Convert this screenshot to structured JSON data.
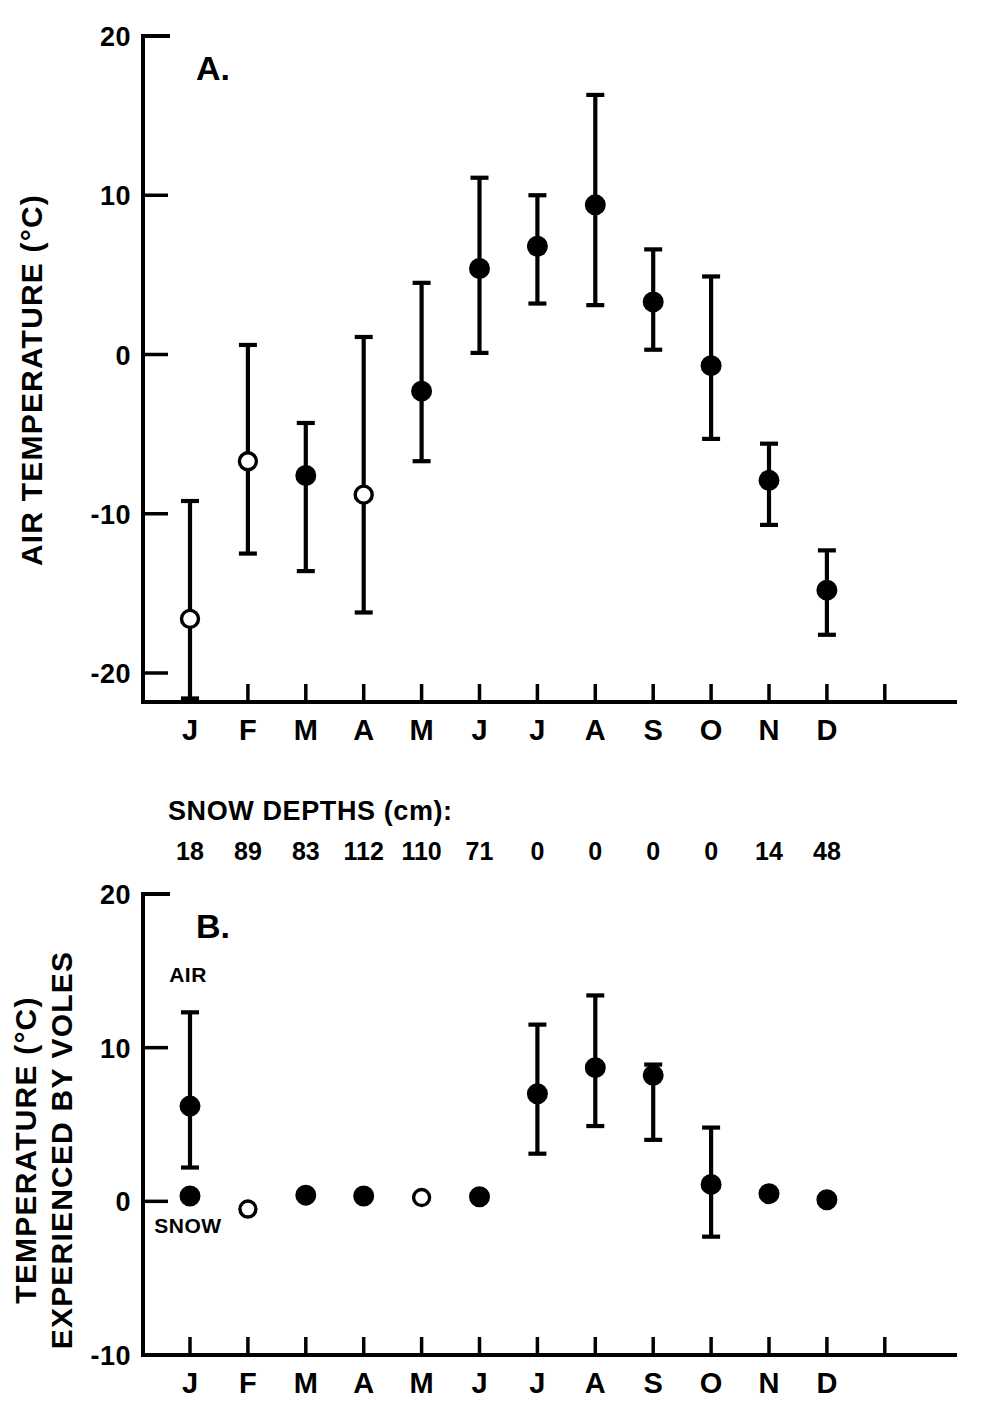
{
  "figure": {
    "background": "#ffffff",
    "ink_color": "#000000",
    "width": 984,
    "height": 1412
  },
  "panelA": {
    "letter": "A.",
    "ylabel": "AIR TEMPERATURE (°C)",
    "ytick_labels": [
      "20",
      "10",
      "0",
      "-10",
      "-20"
    ],
    "xtick_labels": [
      "J",
      "F",
      "M",
      "A",
      "M",
      "J",
      "J",
      "A",
      "S",
      "O",
      "N",
      "D"
    ]
  },
  "snow": {
    "header": "SNOW DEPTHS (cm):",
    "values": [
      "18",
      "89",
      "83",
      "112",
      "110",
      "71",
      "0",
      "0",
      "0",
      "0",
      "14",
      "48"
    ]
  },
  "panelB": {
    "letter": "B.",
    "ylabel_line1": "TEMPERATURE (°C)",
    "ylabel_line2": "EXPERIENCED BY VOLES",
    "ytick_labels": [
      "20",
      "10",
      "0",
      "-10"
    ],
    "xtick_labels": [
      "J",
      "F",
      "M",
      "A",
      "M",
      "J",
      "J",
      "A",
      "S",
      "O",
      "N",
      "D"
    ],
    "annotation_air": "AIR",
    "annotation_snow": "SNOW"
  },
  "chart_data": [
    {
      "type": "scatter",
      "id": "panel-A",
      "title": "A.",
      "xlabel": "",
      "ylabel": "AIR TEMPERATURE (°C)",
      "categories": [
        "J",
        "F",
        "M",
        "A",
        "M",
        "J",
        "J",
        "A",
        "S",
        "O",
        "N",
        "D"
      ],
      "ylim": [
        -20,
        20
      ],
      "yticks": [
        20,
        10,
        0,
        -10,
        -20
      ],
      "grid": false,
      "legend": null,
      "series": [
        {
          "name": "Mean monthly air temperature with range",
          "marker_styles": [
            "open",
            "open",
            "filled",
            "open",
            "filled",
            "filled",
            "filled",
            "filled",
            "filled",
            "filled",
            "filled",
            "filled"
          ],
          "values": [
            -16.6,
            -6.7,
            -7.6,
            -8.8,
            -2.3,
            5.4,
            6.8,
            9.4,
            3.3,
            -0.7,
            -7.9,
            -14.8
          ],
          "err_low": [
            -21.6,
            -12.5,
            -13.6,
            -16.2,
            -6.7,
            0.1,
            3.2,
            3.1,
            0.3,
            -5.3,
            -10.7,
            -17.6
          ],
          "err_high": [
            -9.2,
            0.6,
            -4.3,
            1.1,
            4.5,
            11.1,
            10.0,
            16.3,
            6.6,
            4.9,
            -5.6,
            -12.3
          ]
        }
      ]
    },
    {
      "type": "scatter",
      "id": "panel-B",
      "title": "B.",
      "xlabel": "",
      "ylabel": "TEMPERATURE (°C) EXPERIENCED BY VOLES",
      "categories": [
        "J",
        "F",
        "M",
        "A",
        "M",
        "J",
        "J",
        "A",
        "S",
        "O",
        "N",
        "D"
      ],
      "ylim": [
        -10,
        20
      ],
      "yticks": [
        20,
        10,
        0,
        -10
      ],
      "grid": false,
      "legend": null,
      "annotations": [
        {
          "text": "AIR",
          "category": "J",
          "value": 13.2
        },
        {
          "text": "SNOW",
          "category": "J",
          "value": -1.6
        }
      ],
      "series": [
        {
          "name": "Temperature experienced by voles with range",
          "marker_styles": [
            "filled",
            "open",
            "filled",
            "filled",
            "open",
            "filled",
            "filled",
            "filled",
            "filled",
            "filled",
            "filled",
            "filled"
          ],
          "values": [
            0.35,
            -0.5,
            0.4,
            0.35,
            0.25,
            0.3,
            7.0,
            8.7,
            8.2,
            1.1,
            0.5,
            0.1
          ],
          "err_low": [
            0.35,
            -0.5,
            0.4,
            0.35,
            0.25,
            0.3,
            3.1,
            4.9,
            4.0,
            -2.3,
            0.5,
            0.1
          ],
          "err_high": [
            0.35,
            -0.5,
            0.4,
            0.35,
            0.25,
            0.3,
            11.5,
            13.4,
            8.9,
            4.8,
            0.5,
            0.1
          ]
        },
        {
          "name": "AIR reference bar (June)",
          "category": "J",
          "value": 6.2,
          "err_low": 2.2,
          "err_high": 12.3,
          "marker_style": "filled"
        }
      ]
    }
  ]
}
